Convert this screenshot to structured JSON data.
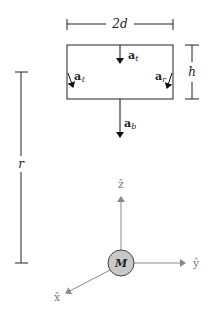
{
  "diagram": {
    "dimensions": {
      "width_label": "2d",
      "height_label": "h",
      "distance_label": "r"
    },
    "accelerations": {
      "top": {
        "main": "a",
        "sub": "t"
      },
      "left": {
        "main": "a",
        "sub": "ℓ"
      },
      "right": {
        "main": "a",
        "sub": "r"
      },
      "bottom": {
        "main": "a",
        "sub": "b"
      }
    },
    "mass": {
      "label": "M",
      "fill": "#c8c8c8"
    },
    "axes": {
      "z": "ẑ",
      "y": "ŷ",
      "x": "x̂",
      "color": "#888888"
    }
  }
}
